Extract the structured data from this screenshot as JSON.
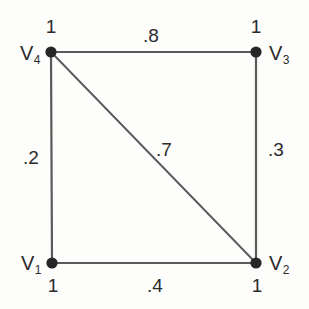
{
  "diagram": {
    "background_color": "#fdfdfc",
    "edge_color": "#5a5a5a",
    "node_color": "#262626",
    "text_color": "#2b2b2b",
    "nodes": [
      {
        "id": "v1",
        "label": "V",
        "subscript": "1",
        "weight": "1",
        "x": 52,
        "y": 263
      },
      {
        "id": "v2",
        "label": "V",
        "subscript": "2",
        "weight": "1",
        "x": 256,
        "y": 263
      },
      {
        "id": "v3",
        "label": "V",
        "subscript": "3",
        "weight": "1",
        "x": 256,
        "y": 52
      },
      {
        "id": "v4",
        "label": "V",
        "subscript": "4",
        "weight": "1",
        "x": 51,
        "y": 52
      }
    ],
    "edges": [
      {
        "id": "e-v4-v3",
        "from": "v4",
        "to": "v3",
        "weight": ".8",
        "label_x": 143,
        "label_y": 26
      },
      {
        "id": "e-v1-v4",
        "from": "v1",
        "to": "v4",
        "weight": ".2",
        "label_x": 23,
        "label_y": 148
      },
      {
        "id": "e-v2-v3",
        "from": "v2",
        "to": "v3",
        "weight": ".3",
        "label_x": 268,
        "label_y": 140
      },
      {
        "id": "e-v1-v2",
        "from": "v1",
        "to": "v2",
        "weight": ".4",
        "label_x": 147,
        "label_y": 276
      },
      {
        "id": "e-v4-v2",
        "from": "v4",
        "to": "v2",
        "weight": ".7",
        "label_x": 156,
        "label_y": 140
      }
    ]
  },
  "chart_data": {
    "type": "diagram",
    "nodes": [
      {
        "name": "V1",
        "weight": 1
      },
      {
        "name": "V2",
        "weight": 1
      },
      {
        "name": "V3",
        "weight": 1
      },
      {
        "name": "V4",
        "weight": 1
      }
    ],
    "edges": [
      {
        "source": "V4",
        "target": "V3",
        "weight": 0.8
      },
      {
        "source": "V1",
        "target": "V4",
        "weight": 0.2
      },
      {
        "source": "V2",
        "target": "V3",
        "weight": 0.3
      },
      {
        "source": "V1",
        "target": "V2",
        "weight": 0.4
      },
      {
        "source": "V4",
        "target": "V2",
        "weight": 0.7
      }
    ]
  }
}
